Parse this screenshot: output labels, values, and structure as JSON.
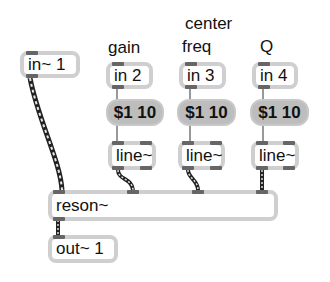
{
  "labels": {
    "gain": "gain",
    "center": "center",
    "freq": "freq",
    "q": "Q"
  },
  "objects": {
    "in1": "in~ 1",
    "in2": "in 2",
    "in3": "in 3",
    "in4": "in 4",
    "line1": "line~",
    "line2": "line~",
    "line3": "line~",
    "reson": "reson~",
    "out1": "out~ 1"
  },
  "messages": {
    "msg1": "$1 10",
    "msg2": "$1 10",
    "msg3": "$1 10"
  },
  "colors": {
    "object_border": "#cfcfcf",
    "message_fill": "#bdbdbd",
    "port": "#666666",
    "control_wire": "#9a9a9a",
    "signal_wire": "#333333"
  }
}
